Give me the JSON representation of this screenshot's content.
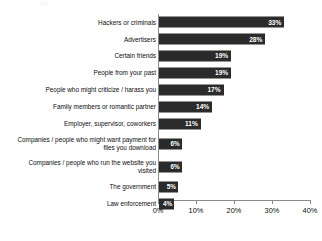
{
  "chart_data": {
    "type": "bar",
    "orientation": "horizontal",
    "title": "",
    "subtitle": "",
    "xlabel": "",
    "ylabel": "",
    "xlim": [
      0,
      40
    ],
    "xticks": [
      "0%",
      "10%",
      "20%",
      "30%",
      "40%"
    ],
    "xtick_values": [
      0,
      10,
      20,
      30,
      40
    ],
    "grid": false,
    "legend": null,
    "bar_color": "#2b2b2b",
    "value_label_color": "#ffffff",
    "axis_color": "#8a8a8a",
    "text_color": "#0d0d0d",
    "categories": [
      "Hackers or criminals",
      "Advertisers",
      "Certain friends",
      "People from your past",
      "People who might criticize / harass you",
      "Family members or romantic partner",
      "Employer, supervisor, coworkers",
      "Companies / people who might want payment for\nfiles you download",
      "Companies / people who run the website you\nvisited",
      "The government",
      "Law enforcement"
    ],
    "values": [
      33,
      28,
      19,
      19,
      17,
      14,
      11,
      6,
      6,
      5,
      4
    ],
    "value_labels": [
      "33%",
      "28%",
      "19%",
      "19%",
      "17%",
      "14%",
      "11%",
      "6%",
      "6%",
      "5%",
      "4%"
    ]
  }
}
